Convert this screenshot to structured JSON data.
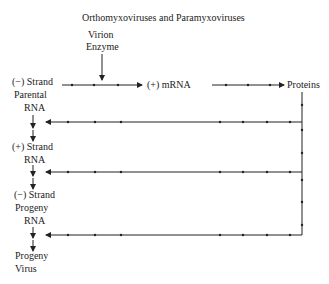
{
  "title": "Orthomyxoviruses and Paramyxoviruses",
  "enzyme_label": {
    "line1": "Virion",
    "line2": "Enzyme"
  },
  "mrna_label": "(+) mRNA",
  "proteins_label": "Proteins",
  "stages": [
    {
      "line1": "(−) Strand",
      "line2": "Parental",
      "line3": "RNA"
    },
    {
      "line1": "(+) Strand",
      "line2": "RNA"
    },
    {
      "line1": "(−) Strand",
      "line2": "Progeny",
      "line3": "RNA"
    },
    {
      "line1": "Progeny",
      "line2": "Virus"
    }
  ],
  "colors": {
    "ink": "#222222",
    "background": "#ffffff"
  }
}
